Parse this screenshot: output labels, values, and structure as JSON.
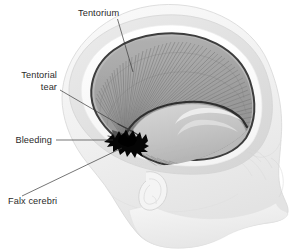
{
  "figure": {
    "background_color": "#ffffff"
  },
  "labels": [
    {
      "id": "tentorium",
      "name": "Tentorium",
      "lines": [
        "Tentorium"
      ],
      "text_x": 78,
      "text_y": 16,
      "anchor": "start",
      "leader": "M117.5,19 L133,72"
    },
    {
      "id": "tentorial-tear",
      "name": "Tentorial tear",
      "lines": [
        "Tentorial",
        "tear"
      ],
      "text_x": 57,
      "text_y": 78,
      "anchor": "end",
      "leader": "M60,90 L132,132"
    },
    {
      "id": "bleeding",
      "name": "Bleeding",
      "lines": [
        "Bleeding"
      ],
      "text_x": 52,
      "text_y": 143,
      "anchor": "end",
      "leader": "M56,140 L113,140"
    },
    {
      "id": "falx-cerebri",
      "name": "Falx cerebri",
      "lines": [
        "Falx cerebri"
      ],
      "text_x": 8,
      "text_y": 204,
      "anchor": "start",
      "leader": "M22,196 L122,148"
    }
  ],
  "colors": {
    "background": "#ffffff",
    "label_text": "#2a2a2a",
    "leader_line": "#3a3a3a",
    "head_fill": "#f2f2f2",
    "head_outline": "#d9d9d9",
    "skull_translucent": "#e4e4e4",
    "skull_inner_band": "#fbfbfb",
    "dura_rim_dark": "#3d3d3d",
    "tentorium_fan": "#8d8d8d",
    "tentorium_field": "#a8a8a8",
    "notch_fill": "#cccccc",
    "bleeding": "#050505",
    "ear_outline": "#d4d4d4"
  },
  "structures": [
    {
      "id": "head-profile",
      "name": "head-profile"
    },
    {
      "id": "cranial-vault",
      "name": "cranial-vault"
    },
    {
      "id": "dura-rim",
      "name": "dura-rim"
    },
    {
      "id": "tentorium-fan",
      "name": "tentorium-fan"
    },
    {
      "id": "tentorial-notch",
      "name": "tentorial-notch"
    },
    {
      "id": "falx-cerebri-edge",
      "name": "falx-cerebri-edge"
    },
    {
      "id": "tentorial-tear-gap",
      "name": "tentorial-tear-gap"
    },
    {
      "id": "bleeding-blob",
      "name": "bleeding-blob"
    },
    {
      "id": "ear",
      "name": "ear"
    },
    {
      "id": "face-profile",
      "name": "face-profile"
    }
  ]
}
